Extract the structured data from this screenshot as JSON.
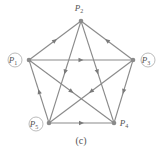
{
  "caption": "(c)",
  "nodes": [
    {
      "id": "P1",
      "name": "P",
      "sub": "1",
      "circled": true
    },
    {
      "id": "P2",
      "name": "P",
      "sub": "2",
      "circled": false
    },
    {
      "id": "P3",
      "name": "P",
      "sub": "3",
      "circled": true
    },
    {
      "id": "P4",
      "name": "P",
      "sub": "4",
      "circled": false
    },
    {
      "id": "P5",
      "name": "P",
      "sub": "5",
      "circled": true
    }
  ],
  "edges": [
    {
      "from": "P1",
      "to": "P2"
    },
    {
      "from": "P3",
      "to": "P2"
    },
    {
      "from": "P1",
      "to": "P3"
    },
    {
      "from": "P2",
      "to": "P5"
    },
    {
      "from": "P2",
      "to": "P4"
    },
    {
      "from": "P3",
      "to": "P4"
    },
    {
      "from": "P5",
      "to": "P1"
    },
    {
      "from": "P5",
      "to": "P4"
    },
    {
      "from": "P1",
      "to": "P4"
    },
    {
      "from": "P3",
      "to": "P5"
    }
  ],
  "colors": {
    "edge": "#8a8a8a",
    "node": "#8a8a8a",
    "label": "#555555"
  }
}
